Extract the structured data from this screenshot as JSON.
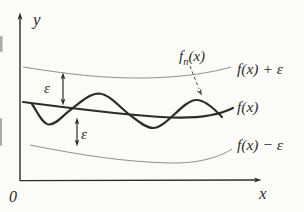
{
  "figure": {
    "axes": {
      "y_label": "y",
      "x_label": "x",
      "origin_label": "0"
    },
    "curve_labels": {
      "fn_f": "f",
      "fn_sub": "n",
      "fn_args": "(x)",
      "f_plus_eps": "f(x) + ε",
      "f": "f(x)",
      "f_minus_eps": "f(x) − ε"
    },
    "epsilon": {
      "upper": "ε",
      "lower": "ε"
    },
    "colors": {
      "background": "#fbfbf8",
      "ink": "#2c2c2c",
      "band": "#8f8f8f",
      "pointer": "#4a4a4a"
    }
  }
}
